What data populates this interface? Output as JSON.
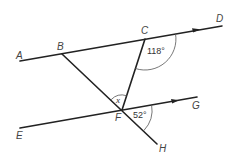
{
  "diagram": {
    "points": {
      "A": "A",
      "B": "B",
      "C": "C",
      "D": "D",
      "E": "E",
      "F": "F",
      "G": "G",
      "H": "H"
    },
    "angles": {
      "angle_at_C": "118°",
      "angle_at_F_right": "52°",
      "angle_at_F_unknown": "x"
    },
    "lines": [
      {
        "name": "AD",
        "from": "A",
        "to": "D",
        "parallel_arrow": true
      },
      {
        "name": "EG",
        "from": "E",
        "to": "G",
        "parallel_arrow": true
      },
      {
        "name": "BH",
        "from": "B",
        "to": "H",
        "through": "F"
      },
      {
        "name": "CF",
        "from": "C",
        "to": "F"
      }
    ],
    "colors": {
      "line": "#222222",
      "label": "#444444",
      "background": "#ffffff"
    }
  }
}
